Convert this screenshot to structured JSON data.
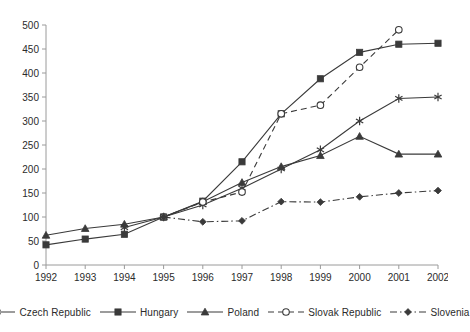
{
  "chart_data": {
    "type": "line",
    "title": "",
    "subtitle": "",
    "xlabel": "",
    "ylabel": "",
    "x": [
      1992,
      1993,
      1994,
      1995,
      1996,
      1997,
      1998,
      1999,
      2000,
      2001,
      2002
    ],
    "categories": [
      "1992",
      "1993",
      "1994",
      "1995",
      "1996",
      "1997",
      "1998",
      "1999",
      "2000",
      "2001",
      "2002"
    ],
    "xlim": [
      1992,
      2002
    ],
    "ylim": [
      0,
      500
    ],
    "yticks": [
      0,
      50,
      100,
      150,
      200,
      250,
      300,
      350,
      400,
      450,
      500
    ],
    "grid": false,
    "legend_position": "bottom",
    "series": [
      {
        "name": "Czech Republic",
        "marker": "star",
        "dash": "solid",
        "color": "#3a3a3a",
        "values": [
          null,
          null,
          78,
          100,
          125,
          160,
          200,
          240,
          300,
          347,
          350
        ]
      },
      {
        "name": "Hungary",
        "marker": "square",
        "dash": "solid",
        "color": "#3a3a3a",
        "values": [
          42,
          54,
          64,
          100,
          133,
          215,
          315,
          388,
          443,
          460,
          462
        ]
      },
      {
        "name": "Poland",
        "marker": "triangle",
        "dash": "solid",
        "color": "#3a3a3a",
        "values": [
          62,
          76,
          85,
          100,
          132,
          172,
          205,
          228,
          268,
          231,
          231
        ]
      },
      {
        "name": "Slovak Republic",
        "marker": "circle-open",
        "dash": "dashed",
        "color": "#3a3a3a",
        "values": [
          null,
          null,
          null,
          100,
          131,
          152,
          315,
          333,
          412,
          490,
          null
        ]
      },
      {
        "name": "Slovenia",
        "marker": "diamond",
        "dash": "dashdot",
        "color": "#3a3a3a",
        "values": [
          null,
          null,
          null,
          100,
          90,
          92,
          132,
          131,
          142,
          150,
          155
        ]
      }
    ]
  },
  "legend": {
    "items": [
      {
        "label": "Czech Republic"
      },
      {
        "label": "Hungary"
      },
      {
        "label": "Poland"
      },
      {
        "label": "Slovak Republic"
      },
      {
        "label": "Slovenia"
      }
    ]
  }
}
